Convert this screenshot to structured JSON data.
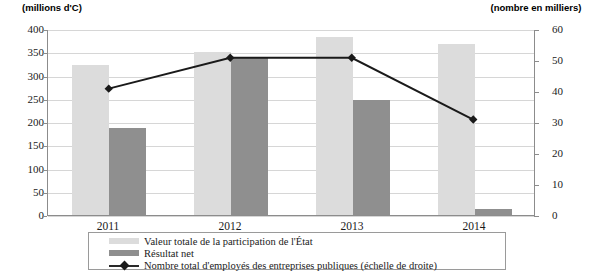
{
  "axes": {
    "left_caption": "(millions d'C)",
    "right_caption": "(nombre en milliers)",
    "left_ticks": [
      "400",
      "350",
      "300",
      "250",
      "200",
      "150",
      "100",
      "50",
      "0"
    ],
    "right_ticks": [
      "60",
      "50",
      "40",
      "30",
      "20",
      "10",
      "0"
    ]
  },
  "legend": {
    "items": [
      {
        "label": "Valeur totale de la participation de l'État",
        "icon": "bar-swatch-light",
        "color": "#dcdcdc"
      },
      {
        "label": "Résultat net",
        "icon": "bar-swatch-dark",
        "color": "#8f8f8f"
      },
      {
        "label": "Nombre total d'employés des entreprises publiques (échelle de droite)",
        "icon": "line-marker-swatch",
        "color": "#1a1a1a"
      }
    ]
  },
  "chart_data": {
    "type": "bar",
    "title": "",
    "subtitle": "",
    "xlabel": "",
    "ylabel": "(millions d'C)",
    "y2label": "(nombre en milliers)",
    "categories": [
      "2011",
      "2012",
      "2013",
      "2014"
    ],
    "ylim": [
      0,
      400
    ],
    "y2lim": [
      0,
      60
    ],
    "ytick_step": 50,
    "y2tick_step": 10,
    "grid": true,
    "legend_position": "bottom",
    "series": [
      {
        "name": "Valeur totale de la participation de l'État",
        "type": "bar",
        "axis": "left",
        "color": "#dcdcdc",
        "values": [
          323,
          350,
          383,
          367
        ]
      },
      {
        "name": "Résultat net",
        "type": "bar",
        "axis": "left",
        "color": "#8f8f8f",
        "values": [
          187,
          337,
          247,
          12
        ]
      },
      {
        "name": "Nombre total d'employés des entreprises publiques (échelle de droite)",
        "type": "line",
        "axis": "right",
        "color": "#1a1a1a",
        "marker": "diamond",
        "values": [
          41,
          51,
          51,
          31
        ]
      }
    ]
  }
}
